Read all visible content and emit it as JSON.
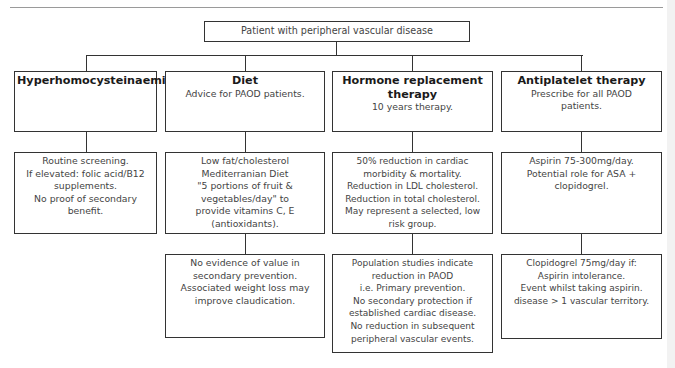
{
  "root": {
    "label": "Patient with peripheral vascular disease"
  },
  "columns": [
    {
      "id": "hyperhomocysteinaemia",
      "header": {
        "title": "Hyperhomocysteinaemia",
        "subtitle": []
      },
      "level2": [
        "Routine screening.",
        "If elevated: folic acid/B12",
        "supplements.",
        "No proof of secondary",
        "benefit."
      ],
      "level3": []
    },
    {
      "id": "diet",
      "header": {
        "title": "Diet",
        "subtitle": [
          "Advice for PAOD patients."
        ]
      },
      "level2": [
        "Low fat/cholesterol",
        "Mediterranian Diet",
        "\"5 portions of fruit &",
        "vegetables/day\" to",
        "provide vitamins C, E",
        "(antioxidants)."
      ],
      "level3": [
        "No evidence of value in",
        "secondary prevention.",
        "Associated weight loss may",
        "improve claudication."
      ]
    },
    {
      "id": "hormone-replacement-therapy",
      "header": {
        "title": [
          "Hormone replacement",
          "therapy"
        ],
        "subtitle": [
          "10 years therapy."
        ]
      },
      "level2": [
        "50% reduction in cardiac",
        "morbidity & mortality.",
        "Reduction in LDL cholesterol.",
        "Reduction in total cholesterol.",
        "May represent a selected, low",
        "risk group."
      ],
      "level3": [
        "Population studies indicate",
        "reduction in PAOD",
        "i.e. Primary prevention.",
        "No secondary protection if",
        "established cardiac disease.",
        "No reduction in subsequent",
        "peripheral vascular events."
      ]
    },
    {
      "id": "antiplatelet-therapy",
      "header": {
        "title": "Antiplatelet therapy",
        "subtitle": [
          "Prescribe for all PAOD",
          "patients."
        ]
      },
      "level2": [
        "Aspirin 75-300mg/day.",
        "Potential role for ASA +",
        "clopidogrel."
      ],
      "level3": [
        "Clopidogrel 75mg/day if:",
        "Aspirin intolerance.",
        "Event whilst taking aspirin.",
        "disease > 1 vascular territory."
      ]
    }
  ]
}
